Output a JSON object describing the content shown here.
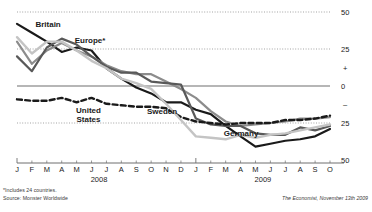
{
  "chart_data": {
    "type": "line",
    "title": "",
    "subtitle": "",
    "xlabel": "",
    "ylabel": "",
    "ylim": [
      -50,
      50
    ],
    "yticks": [
      50,
      25,
      0,
      -25,
      -50
    ],
    "ytick_labels": [
      "50",
      "25",
      "0",
      "25",
      "50"
    ],
    "y_sign_markers": [
      "+",
      "–"
    ],
    "grid": "dotted horizontal gridlines at 50, 25, -25; solid zero line",
    "legend_position": "inline-annotations",
    "x": [
      "J",
      "F",
      "M",
      "A",
      "M",
      "J",
      "J",
      "A",
      "S",
      "O",
      "N",
      "D",
      "J",
      "F",
      "M",
      "A",
      "M",
      "J",
      "J",
      "A",
      "S",
      "O"
    ],
    "xtick_labels": [
      "J",
      "F",
      "M",
      "A",
      "M",
      "J",
      "J",
      "A",
      "S",
      "O",
      "N",
      "D",
      "J",
      "F",
      "M",
      "A",
      "M",
      "J",
      "J",
      "A",
      "S",
      "O"
    ],
    "year_groups": [
      {
        "label": "2008",
        "start_index": 0,
        "end_index": 11
      },
      {
        "label": "2009",
        "start_index": 12,
        "end_index": 21
      }
    ],
    "series": [
      {
        "name": "Britain",
        "color": "#1a1a1a",
        "style": "solid",
        "width": 2.2,
        "label_x_index": 0.9,
        "values": [
          42,
          36,
          30,
          23,
          26,
          24,
          12,
          5,
          -1,
          -5,
          -11,
          -11,
          -16,
          -19,
          -27,
          -34,
          -41,
          -39,
          -37,
          -36,
          -34,
          -29
        ]
      },
      {
        "name": "Europe*",
        "color": "#8c8c8c",
        "style": "solid",
        "width": 2.2,
        "label_x_index": 3.6,
        "values": [
          30,
          15,
          24,
          29,
          24,
          20,
          14,
          10,
          8,
          8,
          3,
          -2,
          -8,
          -17,
          -24,
          -27,
          -26,
          -25,
          -24,
          -22,
          -22,
          -21
        ]
      },
      {
        "name": "Germany",
        "color": "#595959",
        "style": "solid",
        "width": 2.2,
        "label_x_index": 13.4,
        "values": [
          20,
          10,
          26,
          32,
          28,
          20,
          13,
          9,
          9,
          3,
          2,
          1,
          -22,
          -26,
          -27,
          -27,
          -32,
          -33,
          -33,
          -28,
          -30,
          -27
        ]
      },
      {
        "name": "United States",
        "color": "#1a1a1a",
        "style": "dashed",
        "width": 2.4,
        "label_x_index": 5.2,
        "values": [
          -9,
          -10,
          -10,
          -8,
          -11,
          -8,
          -12,
          -13,
          -14,
          -14,
          -15,
          -21,
          -24,
          -25,
          -26,
          -25,
          -25,
          -25,
          -23,
          -23,
          -22,
          -20
        ]
      },
      {
        "name": "Sweden",
        "color": "#c4c4c4",
        "style": "solid",
        "width": 2.4,
        "label_x_index": 9.6,
        "values": [
          33,
          22,
          30,
          30,
          24,
          17,
          12,
          5,
          2,
          -2,
          -12,
          -23,
          -34,
          -35,
          -36,
          -33,
          -35,
          -33,
          -32,
          -30,
          -28,
          -26
        ]
      }
    ]
  },
  "footnote": {
    "line1": "*Includes 24 countries.",
    "line2": "Source: Monster Worldwide"
  },
  "credit": "The Economist, November 13th 2009"
}
